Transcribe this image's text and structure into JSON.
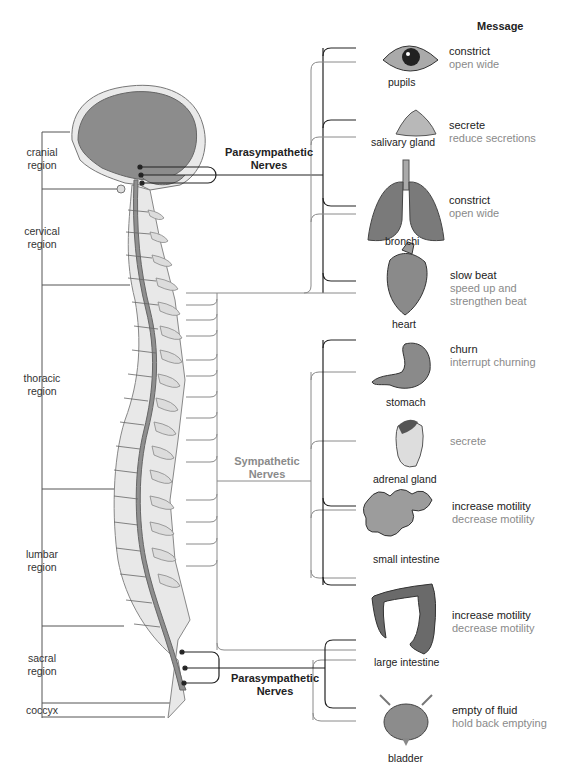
{
  "header": {
    "message_label": "Message"
  },
  "regions": [
    {
      "name": "cranial",
      "label": "cranial\nregion",
      "line1": "cranial",
      "line2": "region"
    },
    {
      "name": "cervical",
      "line1": "cervical",
      "line2": "region"
    },
    {
      "name": "thoracic",
      "line1": "thoracic",
      "line2": "region"
    },
    {
      "name": "lumbar",
      "line1": "lumbar",
      "line2": "region"
    },
    {
      "name": "sacral",
      "line1": "sacral",
      "line2": "region"
    },
    {
      "name": "coccyx",
      "line1": "coccyx"
    }
  ],
  "nerve_labels": {
    "parasympathetic_top": {
      "line1": "Parasympathetic",
      "line2": "Nerves"
    },
    "sympathetic": {
      "line1": "Sympathetic",
      "line2": "Nerves"
    },
    "parasympathetic_bottom": {
      "line1": "Parasympathetic",
      "line2": "Nerves"
    }
  },
  "organs": [
    {
      "name": "pupils",
      "parasympathetic": "constrict",
      "sympathetic": "open wide"
    },
    {
      "name": "salivary gland",
      "parasympathetic": "secrete",
      "sympathetic": "reduce secretions"
    },
    {
      "name": "bronchi",
      "parasympathetic": "constrict",
      "sympathetic": "open wide"
    },
    {
      "name": "heart",
      "parasympathetic": "slow beat",
      "sympathetic": "speed up and",
      "sympathetic2": "strengthen beat"
    },
    {
      "name": "stomach",
      "parasympathetic": "churn",
      "sympathetic": "interrupt churning"
    },
    {
      "name": "adrenal gland",
      "parasympathetic": "",
      "sympathetic": "secrete"
    },
    {
      "name": "small intestine",
      "parasympathetic": "increase motility",
      "sympathetic": "decrease motility"
    },
    {
      "name": "large intestine",
      "parasympathetic": "increase motility",
      "sympathetic": "decrease motility"
    },
    {
      "name": "bladder",
      "parasympathetic": "empty of fluid",
      "sympathetic": "hold back emptying"
    }
  ],
  "colors": {
    "parasympathetic_line": "#222222",
    "sympathetic_line": "#8a8a8a",
    "brain": "#8c8c8c",
    "cord": "#8f8f8f",
    "vertebra": "#e6e6e6"
  }
}
